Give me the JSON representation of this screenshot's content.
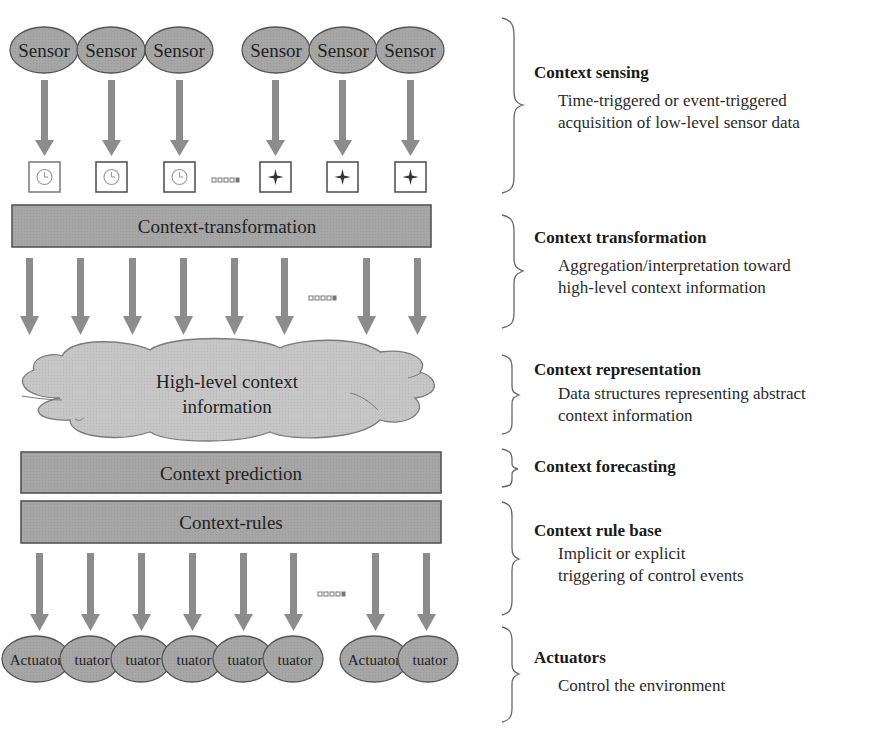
{
  "diagram": {
    "colors": {
      "fill": "#a9a9a9",
      "cloud_fill": "#c4c4c4",
      "stroke": "#555555",
      "arrow": "#8c8c8c",
      "text": "#222222"
    },
    "sensors": {
      "label": "Sensor",
      "count": 6,
      "triggers": [
        {
          "icon": "clock-icon",
          "glyph": "◷"
        },
        {
          "icon": "clock-icon",
          "glyph": "◷"
        },
        {
          "icon": "clock-icon",
          "glyph": "◷"
        },
        {
          "icon": "event-star-icon",
          "glyph": "✦"
        },
        {
          "icon": "event-star-icon",
          "glyph": "✦"
        },
        {
          "icon": "event-star-icon",
          "glyph": "✦"
        }
      ]
    },
    "ellipsis": "▫▫▫▫▪",
    "transformation_bar": "Context-transformation",
    "cloud": {
      "line1": "High-level context",
      "line2": "information"
    },
    "prediction_bar": "Context prediction",
    "rules_bar": "Context-rules",
    "actuators": {
      "full_label": "Actuator",
      "partial_label": "tuator",
      "labels": [
        "Actuator",
        "tuator",
        "tuator",
        "tuator",
        "tuator",
        "tuator",
        "Actuator",
        "tuator"
      ]
    }
  },
  "layers": [
    {
      "title": "Context sensing",
      "description": [
        "Time-triggered or event-triggered",
        "acquisition of low-level sensor data"
      ]
    },
    {
      "title": "Context transformation",
      "description": [
        "Aggregation/interpretation toward",
        "high-level context information"
      ]
    },
    {
      "title": "Context representation",
      "description": [
        "Data structures representing abstract",
        "context information"
      ]
    },
    {
      "title": "Context forecasting",
      "description": []
    },
    {
      "title": "Context rule base",
      "description": [
        "Implicit or explicit",
        "triggering of control events"
      ]
    },
    {
      "title": "Actuators",
      "description": [
        "Control the environment"
      ]
    }
  ]
}
